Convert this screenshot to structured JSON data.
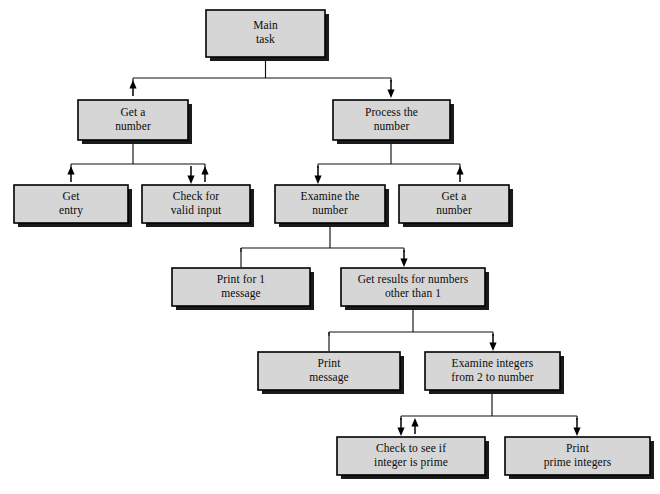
{
  "diagram": {
    "type": "hierarchy-structure-chart",
    "background_color": "#ffffff",
    "box_fill_color": "#d6d6d6",
    "box_border_color": "#000000",
    "shadow_color": "#1a1a1a",
    "line_color": "#111111",
    "canvas": {
      "width": 660,
      "height": 494
    },
    "nodes": [
      {
        "id": "main-task",
        "lines": [
          "Main",
          "task"
        ],
        "x": 206,
        "y": 10,
        "w": 119,
        "h": 47,
        "level": 0
      },
      {
        "id": "get-a-number",
        "lines": [
          "Get a",
          "number"
        ],
        "x": 78,
        "y": 100,
        "w": 110,
        "h": 40,
        "level": 1
      },
      {
        "id": "process-the-number",
        "lines": [
          "Process the",
          "number"
        ],
        "x": 333,
        "y": 100,
        "w": 117,
        "h": 40,
        "level": 1
      },
      {
        "id": "get-entry",
        "lines": [
          "Get",
          "entry"
        ],
        "x": 14,
        "y": 185,
        "w": 114,
        "h": 38,
        "level": 2
      },
      {
        "id": "check-for-valid-input",
        "lines": [
          "Check for",
          "valid input"
        ],
        "x": 142,
        "y": 185,
        "w": 108,
        "h": 38,
        "level": 2
      },
      {
        "id": "examine-the-number",
        "lines": [
          "Examine the",
          "number"
        ],
        "x": 275,
        "y": 185,
        "w": 110,
        "h": 38,
        "level": 2
      },
      {
        "id": "get-a-number-2",
        "lines": [
          "Get a",
          "number"
        ],
        "x": 399,
        "y": 185,
        "w": 110,
        "h": 38,
        "level": 2
      },
      {
        "id": "print-for-1-message",
        "lines": [
          "Print for 1",
          "message"
        ],
        "x": 172,
        "y": 268,
        "w": 138,
        "h": 38,
        "level": 3
      },
      {
        "id": "get-results-other-than-1",
        "lines": [
          "Get results for numbers",
          "other than 1"
        ],
        "x": 341,
        "y": 268,
        "w": 144,
        "h": 38,
        "level": 3
      },
      {
        "id": "print-message",
        "lines": [
          "Print",
          "message"
        ],
        "x": 258,
        "y": 352,
        "w": 142,
        "h": 38,
        "level": 4
      },
      {
        "id": "examine-integers",
        "lines": [
          "Examine integers",
          "from 2 to number"
        ],
        "x": 425,
        "y": 352,
        "w": 135,
        "h": 38,
        "level": 4
      },
      {
        "id": "check-integer-prime",
        "lines": [
          "Check to see if",
          "integer is prime"
        ],
        "x": 337,
        "y": 437,
        "w": 148,
        "h": 38,
        "level": 5
      },
      {
        "id": "print-prime-integers",
        "lines": [
          "Print",
          "prime integers"
        ],
        "x": 505,
        "y": 437,
        "w": 145,
        "h": 38,
        "level": 5
      }
    ],
    "connectors": [
      {
        "id": "main-to-bus",
        "from": "main-task",
        "kind": "stem-down",
        "bus_y": 78
      },
      {
        "id": "bus-level1",
        "kind": "bus",
        "y": 78,
        "x1": 133,
        "x2": 391
      },
      {
        "id": "main-to-get-a-number",
        "kind": "arrow-up",
        "x": 133,
        "from_y": 96,
        "to_y": 80
      },
      {
        "id": "main-to-process",
        "kind": "arrow-down",
        "x": 391,
        "from_y": 80,
        "to_y": 98
      },
      {
        "id": "get-a-number-stem",
        "kind": "stem-down",
        "x": 133,
        "from_y": 140,
        "to_y": 164
      },
      {
        "id": "bus-level2-left",
        "kind": "bus",
        "y": 164,
        "x1": 71,
        "x2": 205
      },
      {
        "id": "to-get-entry",
        "kind": "arrow-up",
        "x": 71,
        "from_y": 182,
        "to_y": 166
      },
      {
        "id": "to-check-valid",
        "kind": "arrow-down",
        "x": 191,
        "from_y": 166,
        "to_y": 184
      },
      {
        "id": "from-check-valid",
        "kind": "arrow-up",
        "x": 205,
        "from_y": 182,
        "to_y": 166
      },
      {
        "id": "process-stem",
        "kind": "stem-down",
        "x": 391,
        "from_y": 140,
        "to_y": 164
      },
      {
        "id": "bus-level2-right",
        "kind": "bus",
        "y": 164,
        "x1": 318,
        "x2": 460
      },
      {
        "id": "to-examine-number",
        "kind": "arrow-down",
        "x": 318,
        "from_y": 166,
        "to_y": 184
      },
      {
        "id": "from-get-a-number-2",
        "kind": "arrow-up",
        "x": 460,
        "from_y": 182,
        "to_y": 166
      },
      {
        "id": "examine-stem",
        "kind": "stem-down",
        "x": 330,
        "from_y": 223,
        "to_y": 248
      },
      {
        "id": "bus-level3",
        "kind": "bus",
        "y": 248,
        "x1": 241,
        "x2": 404
      },
      {
        "id": "to-print-for-1",
        "kind": "plain-down",
        "x": 241,
        "from_y": 248,
        "to_y": 267
      },
      {
        "id": "to-get-results",
        "kind": "arrow-down",
        "x": 404,
        "from_y": 250,
        "to_y": 267
      },
      {
        "id": "get-results-stem",
        "kind": "stem-down",
        "x": 413,
        "from_y": 306,
        "to_y": 332
      },
      {
        "id": "bus-level4",
        "kind": "bus",
        "y": 332,
        "x1": 329,
        "x2": 493
      },
      {
        "id": "to-print-message",
        "kind": "plain-down",
        "x": 329,
        "from_y": 332,
        "to_y": 351
      },
      {
        "id": "to-examine-integers",
        "kind": "arrow-down",
        "x": 493,
        "from_y": 334,
        "to_y": 351
      },
      {
        "id": "examine-integers-stem",
        "kind": "stem-down",
        "x": 492,
        "from_y": 390,
        "to_y": 416
      },
      {
        "id": "bus-level5",
        "kind": "bus",
        "y": 416,
        "x1": 401,
        "x2": 577
      },
      {
        "id": "to-check-prime",
        "kind": "arrow-down",
        "x": 401,
        "from_y": 418,
        "to_y": 436
      },
      {
        "id": "from-check-prime",
        "kind": "arrow-up",
        "x": 415,
        "from_y": 434,
        "to_y": 418
      },
      {
        "id": "to-print-prime",
        "kind": "arrow-down",
        "x": 577,
        "from_y": 418,
        "to_y": 436
      }
    ]
  }
}
